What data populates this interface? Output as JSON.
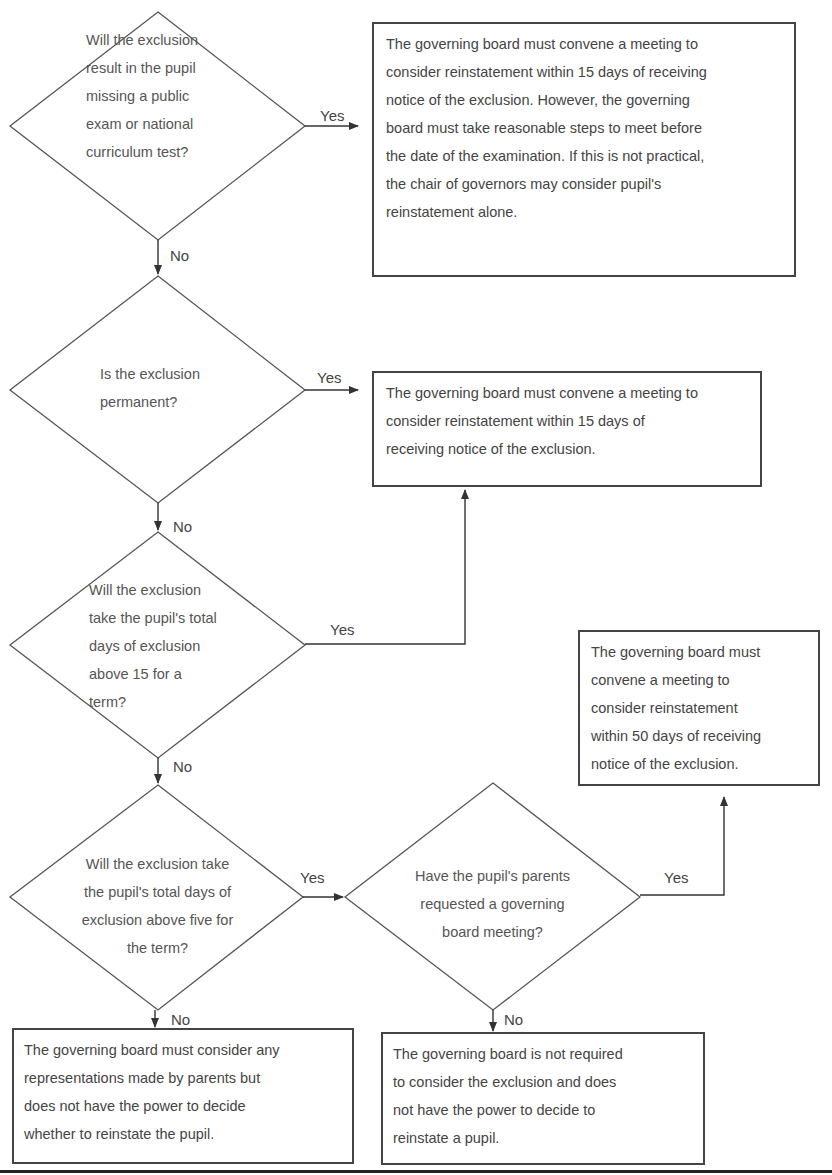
{
  "diagram": {
    "decisions": [
      {
        "id": "d1",
        "lines": [
          "Will the exclusion",
          "result in the pupil",
          "missing a public",
          "exam or national",
          "curriculum test?"
        ]
      },
      {
        "id": "d2",
        "lines": [
          "Is the exclusion",
          "permanent?"
        ]
      },
      {
        "id": "d3",
        "lines": [
          "Will the exclusion",
          "take the pupil's total",
          "days of exclusion",
          "above  15 for a",
          "term?"
        ]
      },
      {
        "id": "d4",
        "lines": [
          "Will the exclusion take",
          "the pupil's total days of",
          "exclusion above five for",
          "the term?"
        ]
      },
      {
        "id": "d5",
        "lines": [
          "Have the pupil's parents",
          "requested a governing",
          "board meeting?"
        ]
      }
    ],
    "outcomes": [
      {
        "id": "o1",
        "lines": [
          "The governing board must convene a meeting to",
          "consider reinstatement within 15 days of receiving",
          "notice of the exclusion. However, the governing",
          "board must take reasonable steps to meet before",
          "the date of the examination. If this is not practical,",
          "the chair of governors may consider pupil's",
          "reinstatement alone."
        ]
      },
      {
        "id": "o2",
        "lines": [
          "The governing board must convene a meeting to",
          "consider reinstatement within 15 days of",
          "receiving notice of the exclusion."
        ]
      },
      {
        "id": "o3",
        "lines": [
          "The governing board must",
          "convene a meeting to",
          "consider reinstatement",
          "within 50 days of receiving",
          "notice of the exclusion."
        ]
      },
      {
        "id": "o4",
        "lines": [
          "The governing board must consider any",
          "representations made by parents but",
          "does not have the power to decide",
          "whether to reinstate the pupil."
        ]
      },
      {
        "id": "o5",
        "lines": [
          "The governing board is not required",
          "to consider the exclusion and does",
          "not have the power to decide to",
          "reinstate a pupil."
        ]
      }
    ],
    "edges": [
      {
        "from": "d1",
        "to": "o1",
        "label": "Yes"
      },
      {
        "from": "d1",
        "to": "d2",
        "label": "No"
      },
      {
        "from": "d2",
        "to": "o2",
        "label": "Yes"
      },
      {
        "from": "d2",
        "to": "d3",
        "label": "No"
      },
      {
        "from": "d3",
        "to": "o2",
        "label": "Yes"
      },
      {
        "from": "d3",
        "to": "d4",
        "label": "No"
      },
      {
        "from": "d4",
        "to": "d5",
        "label": "Yes"
      },
      {
        "from": "d4",
        "to": "o4",
        "label": "No"
      },
      {
        "from": "d5",
        "to": "o3",
        "label": "Yes"
      },
      {
        "from": "d5",
        "to": "o5",
        "label": "No"
      }
    ],
    "colors": {
      "stroke": "#444444",
      "text": "#4a4a4a",
      "background": "#ffffff"
    }
  }
}
